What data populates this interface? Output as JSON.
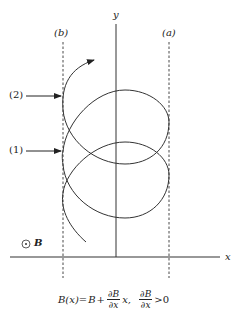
{
  "diagram": {
    "type": "physics-diagram",
    "axes": {
      "x_label": "x",
      "y_label": "y"
    },
    "boundaries": [
      {
        "label": "(b)",
        "style": "dashed",
        "position": "left"
      },
      {
        "label": "(a)",
        "style": "dashed",
        "position": "right"
      }
    ],
    "markers": [
      {
        "label": "(2)",
        "points_to": "upper left tangent point"
      },
      {
        "label": "(1)",
        "points_to": "lower left tangent point"
      }
    ],
    "field": {
      "symbol": "⊙",
      "label": "B",
      "description": "magnetic field out of page"
    },
    "trajectory": "drifting cyclotron orbit (loops) moving upward",
    "formula": {
      "lhs": "B(x)=",
      "b": "B",
      "plus": "+",
      "frac_num": "∂B",
      "frac_den": "∂x",
      "x_term": "x,",
      "frac2_num": "∂B",
      "frac2_den": "∂x",
      "condition": ">0"
    }
  },
  "colors": {
    "line": "#333333",
    "background": "#ffffff"
  }
}
